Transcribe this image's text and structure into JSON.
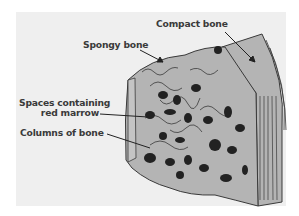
{
  "diagram": {
    "labels": {
      "compact_bone": "Compact bone",
      "spongy_bone": "Spongy bone",
      "marrow_line1": "Spaces containing",
      "marrow_line2": "red marrow",
      "columns": "Columns of bone"
    },
    "colors": {
      "background": "#efefef",
      "bone_fill": "#b4b4b4",
      "outline": "#3a3a3a",
      "marrow": "#222222",
      "text": "#3a3a3a"
    }
  }
}
